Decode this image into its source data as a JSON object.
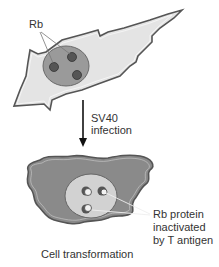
{
  "diagram": {
    "top_cell": {
      "label_rb": "Rb"
    },
    "transition": {
      "line1": "SV40",
      "line2": "infection"
    },
    "bottom_cell": {
      "annotation_line1": "Rb protein",
      "annotation_line2": "inactivated",
      "annotation_line3": "by T antigen",
      "caption": "Cell transformation"
    },
    "colors": {
      "top_cytoplasm": "#e4e4e4",
      "top_nucleus": "#9a9a9a",
      "rb_granule": "#555555",
      "bottom_cytoplasm": "#8a8a8a",
      "bottom_nucleus": "#d2d2d2",
      "outline": "#555555",
      "arrow": "#111111"
    }
  }
}
